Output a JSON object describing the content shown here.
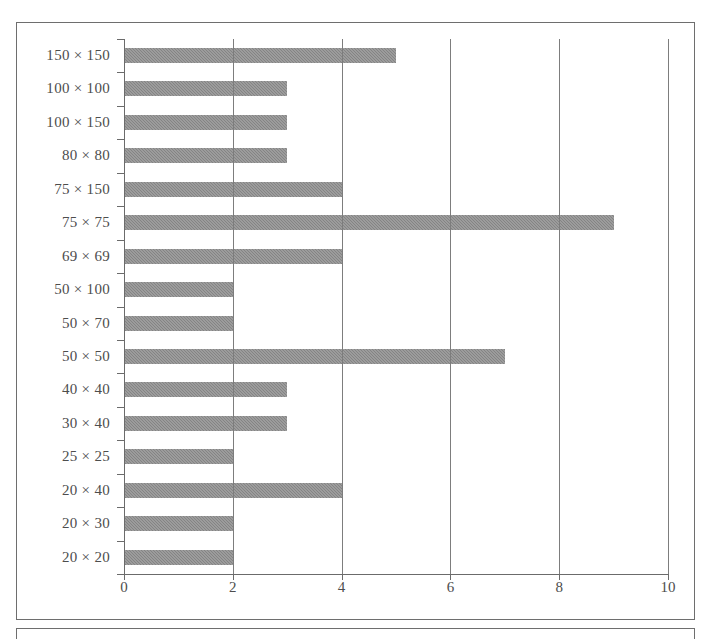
{
  "chart_data": {
    "type": "bar",
    "orientation": "horizontal",
    "title": "",
    "subtitle": "",
    "xlabel": "",
    "ylabel": "",
    "xlim": [
      0,
      10
    ],
    "xticks": [
      "0",
      "2",
      "4",
      "6",
      "8",
      "10"
    ],
    "xtick_values": [
      0,
      2,
      4,
      6,
      8,
      10
    ],
    "grid": "vertical",
    "legend": "none",
    "bar_color": "#8b8b8b",
    "axis_color": "#6b6b6b",
    "categories": [
      "150 × 150",
      "100 × 100",
      "100 × 150",
      "80 × 80",
      "75 × 150",
      "75 × 75",
      "69 × 69",
      "50 × 100",
      "50 × 70",
      "50 × 50",
      "40 × 40",
      "30 × 40",
      "25 × 25",
      "20 × 40",
      "20 × 30",
      "20 × 20"
    ],
    "values": [
      5,
      3,
      3,
      3,
      4,
      9,
      4,
      2,
      2,
      7,
      3,
      3,
      2,
      4,
      2,
      2
    ]
  }
}
